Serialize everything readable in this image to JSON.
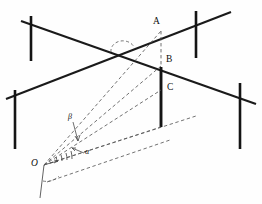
{
  "figure": {
    "type": "line-diagram",
    "canvas": {
      "width": 262,
      "height": 204
    },
    "colors": {
      "background": "#fefefe",
      "solid_stroke": "#1a1a1a",
      "post_stroke": "#141414",
      "dashed_stroke": "#585858",
      "label_color": "#0d0d0d"
    },
    "labels": {
      "point_a": "A",
      "point_b": "B",
      "point_c": "C",
      "point_o": "O",
      "angle_alpha": "α",
      "angle_beta": "β"
    },
    "geometry": {
      "main_line_up": {
        "x1": 6,
        "y1": 99,
        "x2": 231,
        "y2": 12
      },
      "main_line_down": {
        "x1": 21,
        "y1": 21,
        "x2": 256,
        "y2": 104
      },
      "vertical_segment_dashed": {
        "x1": 161,
        "y1": 31,
        "x2": 161,
        "y2": 66
      },
      "vertical_segment_solid": {
        "x1": 161,
        "y1": 67,
        "x2": 161,
        "y2": 127
      },
      "observer_point": {
        "x": 44,
        "y": 165
      },
      "posts": [
        {
          "name": "post-top-left",
          "x": 31,
          "y1": 16,
          "y2": 61
        },
        {
          "name": "post-top-right",
          "x": 196,
          "y1": 11,
          "y2": 58
        },
        {
          "name": "post-bottom-left",
          "x": 15,
          "y1": 90,
          "y2": 149
        },
        {
          "name": "post-bottom-right",
          "x": 240,
          "y1": 83,
          "y2": 149
        }
      ],
      "rays_from_o": [
        {
          "name": "ray-o-to-a",
          "to_x": 161,
          "to_y": 31
        },
        {
          "name": "ray-o-to-b",
          "to_x": 161,
          "to_y": 66
        },
        {
          "name": "ray-o-to-c",
          "to_x": 161,
          "to_y": 90
        },
        {
          "name": "ray-o-to-foot",
          "to_x": 161,
          "to_y": 127
        }
      ],
      "arc_at_crossing": {
        "cx": 122,
        "cy": 49,
        "r": 11
      },
      "angle_arc_at_o": {
        "cx": 44,
        "cy": 165,
        "r": 16
      }
    }
  }
}
